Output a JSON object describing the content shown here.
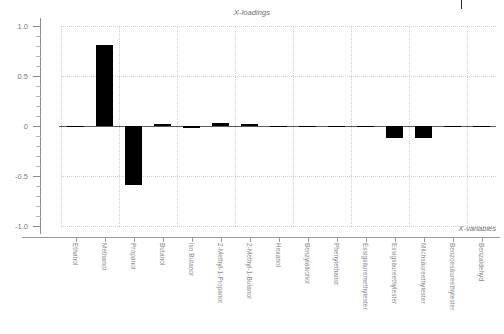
{
  "chart_data": {
    "type": "bar",
    "title": "X-loadings",
    "xlabel": "X-variables",
    "ylabel": "",
    "ylim": [
      -1.0,
      1.0
    ],
    "ytick_labels": [
      "1.0",
      "0.5",
      "0",
      "-0.5",
      "-1.0"
    ],
    "ytick_values": [
      1.0,
      0.5,
      0,
      -0.5,
      -1.0
    ],
    "grid": true,
    "legend": null,
    "bar_color": "#000000",
    "categories": [
      "Ethanol",
      "Methanol",
      "Propanol",
      "Butanol",
      "iso Butanol",
      "2-Methyl-1-Propanol",
      "2-Methyl-1-Butanol",
      "Hexanol",
      "Benzylalkohol",
      "Phenylethanol",
      "Essigsäuremethylester",
      "Essigsäureethylester",
      "Milchsäureethylester",
      "Benzoesäureethylester",
      "Benzaldehyd"
    ],
    "values": [
      0.0,
      0.81,
      -0.59,
      0.02,
      -0.02,
      0.035,
      0.025,
      -0.005,
      0.0,
      0.0,
      -0.012,
      -0.12,
      -0.115,
      -0.005,
      -0.012
    ]
  },
  "marks": {
    "corner_tick": "top-right-tick"
  }
}
